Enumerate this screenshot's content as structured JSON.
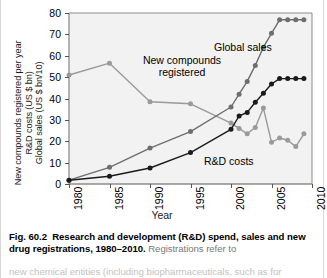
{
  "figure": {
    "number": "Fig. 60.2",
    "caption_bold": "Research and development (R&D) spend, sales and new drug registrations, 1980–2010.",
    "caption_rest": " Registrations refer to",
    "caption_line3": "new chemical entities (including biopharmaceuticals, such as for"
  },
  "chart_data": {
    "type": "line",
    "title": "",
    "xlabel": "Year",
    "ylabel": "New compounds registered per year / R&D costs (US $ bn) / Global sales (US $ bn/10)",
    "ylabel_lines": [
      "New compounds registered per year",
      "R&D costs (US $ bn)",
      "Global sales (US $ bn/10)"
    ],
    "xlim": [
      1980,
      2010
    ],
    "ylim": [
      0,
      80
    ],
    "yticks": [
      0,
      10,
      20,
      30,
      40,
      50,
      60,
      70,
      80
    ],
    "xticks": [
      1980,
      1985,
      1990,
      1995,
      2000,
      2005,
      2010
    ],
    "xtick_labels": [
      "1980",
      "1985",
      "1990",
      "1995",
      "2000",
      "2005",
      "2010"
    ],
    "grid": false,
    "legend": "inline-annotations",
    "colors": {
      "new_compounds": "#9a9a9a",
      "global_sales": "#6e6e6e",
      "rd_costs": "#1b1b1b",
      "plot_background": "#f2f2f2",
      "axis": "#555555"
    },
    "series": [
      {
        "name": "New compounds registered",
        "color": "#9a9a9a",
        "x": [
          1980,
          1985,
          1990,
          1995,
          2000,
          2001,
          2002,
          2003,
          2004,
          2005,
          2006,
          2007,
          2008,
          2009
        ],
        "values": [
          51,
          56.5,
          38.5,
          37.5,
          28.5,
          26,
          23.5,
          26.5,
          35.5,
          19.5,
          21.5,
          20.5,
          17.5,
          23.5
        ]
      },
      {
        "name": "Global sales",
        "color": "#6e6e6e",
        "x": [
          1980,
          1985,
          1990,
          1995,
          2000,
          2001,
          2002,
          2003,
          2004,
          2005,
          2006,
          2007,
          2008,
          2009
        ],
        "values": [
          1.8,
          7.8,
          16.8,
          24.5,
          36,
          42,
          48,
          55.5,
          64,
          70.5,
          76.8,
          76.8,
          76.8,
          76.8
        ]
      },
      {
        "name": "R&D costs",
        "color": "#1b1b1b",
        "x": [
          1980,
          1985,
          1990,
          1995,
          2000,
          2001,
          2002,
          2003,
          2004,
          2005,
          2006,
          2007,
          2008,
          2009
        ],
        "values": [
          1.8,
          3.6,
          7.5,
          14.7,
          25.6,
          31.8,
          33.5,
          38.2,
          42.5,
          46.8,
          49.3,
          49.3,
          49.3,
          49.3
        ]
      }
    ],
    "annotations": [
      {
        "name": "global-sales-label",
        "text": "Global sales"
      },
      {
        "name": "new-compounds-label",
        "text_line1": "New compounds",
        "text_line2": "registered"
      },
      {
        "name": "rd-costs-label",
        "text": "R&D costs"
      }
    ]
  }
}
